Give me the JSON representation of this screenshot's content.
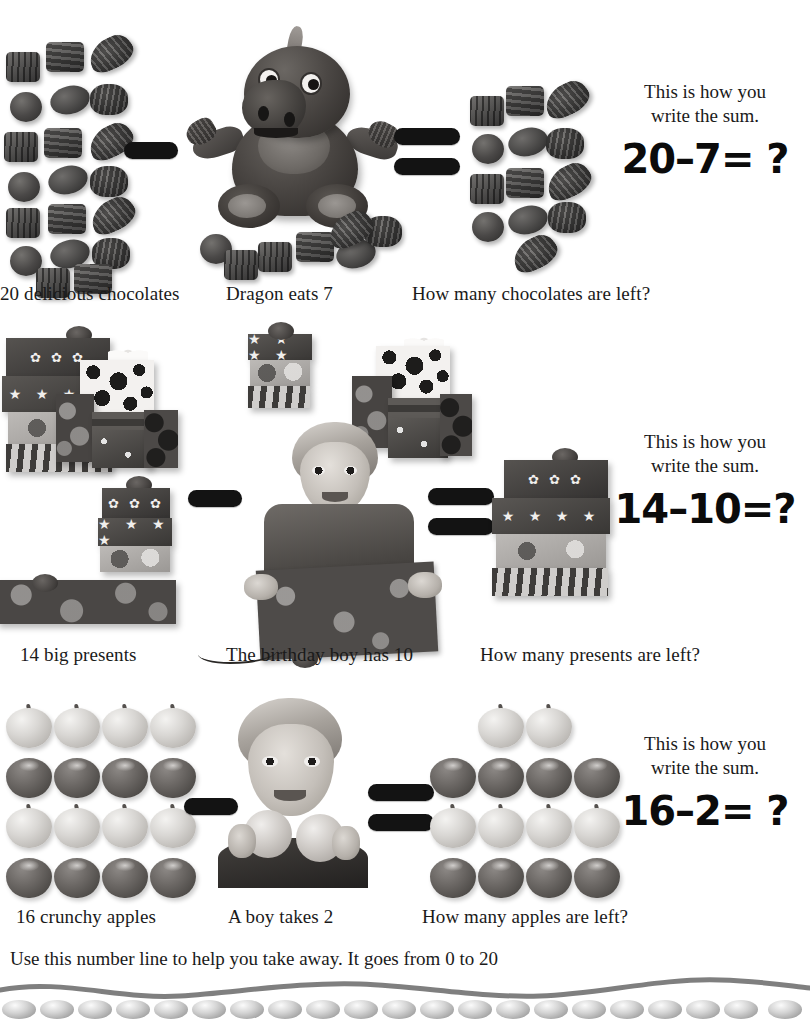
{
  "page": {
    "background": "#ffffff"
  },
  "problems": [
    {
      "id": "chocolates",
      "left_caption": "20 delicious chocolates",
      "middle_caption": "Dragon eats 7",
      "right_caption": "How many chocolates are left?",
      "sum_lead_line1": "This is how you",
      "sum_lead_line2": "write the sum.",
      "sum_expression": "20–7= ?",
      "minuend": 20,
      "subtrahend": 7,
      "remaining": 13,
      "operator_minus": "–",
      "operator_equals": "=",
      "item_name": "chocolate",
      "actor": "Dragon"
    },
    {
      "id": "presents",
      "left_caption": "14 big presents",
      "middle_caption": "The birthday boy has 10",
      "right_caption": "How many presents are left?",
      "sum_lead_line1": "This is how you",
      "sum_lead_line2": "write the sum.",
      "sum_expression": "14–10=?",
      "minuend": 14,
      "subtrahend": 10,
      "remaining": 4,
      "operator_minus": "–",
      "operator_equals": "=",
      "item_name": "present",
      "actor": "The birthday boy"
    },
    {
      "id": "apples",
      "left_caption": "16 crunchy apples",
      "middle_caption": "A boy takes 2",
      "right_caption": "How many apples are left?",
      "sum_lead_line1": "This is how you",
      "sum_lead_line2": "write the sum.",
      "sum_expression": "16–2= ?",
      "minuend": 16,
      "subtrahend": 2,
      "remaining": 14,
      "operator_minus": "–",
      "operator_equals": "=",
      "item_name": "apple",
      "actor": "A boy"
    }
  ],
  "footer": {
    "instruction": "Use this number line to help you take away. It goes from 0 to 20",
    "range_start": 0,
    "range_end": 20,
    "bead_count": 21
  },
  "colors": {
    "text": "#1a1a1a",
    "operator": "#131313",
    "wave": "#7f7f7f",
    "bead_light": "#fbfbfb",
    "bead_dark": "#8d8d8d"
  }
}
